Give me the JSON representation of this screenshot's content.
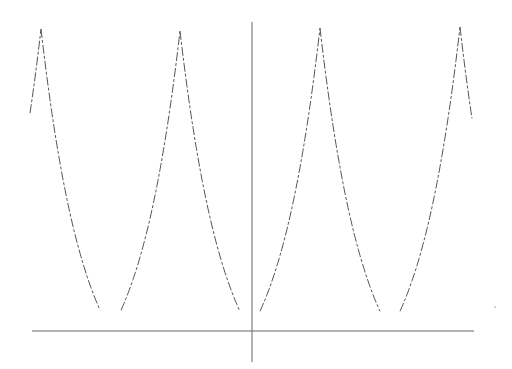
{
  "chart_data": {
    "type": "line",
    "title": "",
    "xlabel": "",
    "ylabel": "",
    "grid": false,
    "legend": null,
    "period_px": 140,
    "peaks_px": [
      [
        41,
        29
      ],
      [
        180,
        31
      ],
      [
        320,
        28
      ],
      [
        460,
        27
      ]
    ],
    "troughs_px": [
      [
        110,
        331
      ],
      [
        250,
        331
      ],
      [
        390,
        331
      ]
    ],
    "curve_start_px": [
      30,
      127
    ],
    "curve_end_px": [
      472,
      125
    ],
    "axes_px": {
      "x_axis": {
        "y": 331,
        "x_from": 32,
        "x_to": 474
      },
      "y_axis": {
        "x": 252,
        "y_from": 22,
        "y_to": 362
      }
    },
    "colors": {
      "curve": "#555555",
      "axis": "#666666",
      "background": "#ffffff"
    }
  }
}
